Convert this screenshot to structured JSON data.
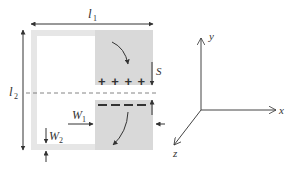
{
  "diagram": {
    "structure": {
      "frame_color": "#e6e6e6",
      "patch_color": "#d9d9d9",
      "line_color": "#333333"
    },
    "labels": {
      "l1": {
        "main": "l",
        "sub": "1"
      },
      "l2": {
        "main": "l",
        "sub": "2"
      },
      "S": "S",
      "W1": {
        "main": "W",
        "sub": "1"
      },
      "W2": {
        "main": "W",
        "sub": "2"
      }
    },
    "charges": {
      "upper_patch": "+ + + +",
      "lower_patch": "– – – –"
    },
    "axes": {
      "x": "x",
      "y": "y",
      "z": "z"
    }
  }
}
